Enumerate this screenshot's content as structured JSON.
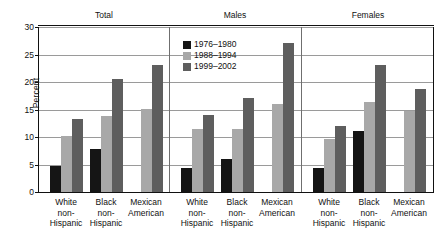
{
  "chart_data": {
    "type": "bar",
    "title": "",
    "xlabel": "",
    "ylabel": "Percent",
    "ylim": [
      0,
      30
    ],
    "yticks": [
      0,
      5,
      10,
      15,
      20,
      25,
      30
    ],
    "grid": true,
    "legend_position": "top-center",
    "panels": [
      "Total",
      "Males",
      "Females"
    ],
    "categories": [
      "White non-Hispanic",
      "Black non-Hispanic",
      "Mexican American"
    ],
    "series": [
      {
        "name": "1976–1980",
        "color": "#151515"
      },
      {
        "name": "1988–1994",
        "color": "#a8a8a8"
      },
      {
        "name": "1999–2002",
        "color": "#5e5e5e"
      }
    ],
    "values": {
      "Total": {
        "White non-Hispanic": [
          5.0,
          10.4,
          13.5
        ],
        "Black non-Hispanic": [
          8.0,
          14.0,
          20.8
        ],
        "Mexican American": [
          null,
          15.2,
          23.2
        ]
      },
      "Males": {
        "White non-Hispanic": [
          4.5,
          11.6,
          14.2
        ],
        "Black non-Hispanic": [
          6.1,
          11.6,
          17.3
        ],
        "Mexican American": [
          null,
          16.2,
          27.3
        ]
      },
      "Females": {
        "White non-Hispanic": [
          4.5,
          9.8,
          12.2
        ],
        "Black non-Hispanic": [
          11.2,
          16.5,
          23.3
        ],
        "Mexican American": [
          null,
          15.0,
          18.9
        ]
      }
    }
  },
  "axis": {
    "y_label": "Percent",
    "y_ticks": [
      "0",
      "5",
      "10",
      "15",
      "20",
      "25",
      "30"
    ]
  },
  "panels": [
    {
      "title": "Total"
    },
    {
      "title": "Males"
    },
    {
      "title": "Females"
    }
  ],
  "legend": {
    "items": [
      {
        "label": "1976–1980",
        "color": "#151515"
      },
      {
        "label": "1988–1994",
        "color": "#a8a8a8"
      },
      {
        "label": "1999–2002",
        "color": "#5e5e5e"
      }
    ]
  },
  "categories": [
    {
      "line1": "White",
      "line2": "non-",
      "line3": "Hispanic"
    },
    {
      "line1": "Black",
      "line2": "non-",
      "line3": "Hispanic"
    },
    {
      "line1": "Mexican",
      "line2": "American",
      "line3": ""
    }
  ]
}
